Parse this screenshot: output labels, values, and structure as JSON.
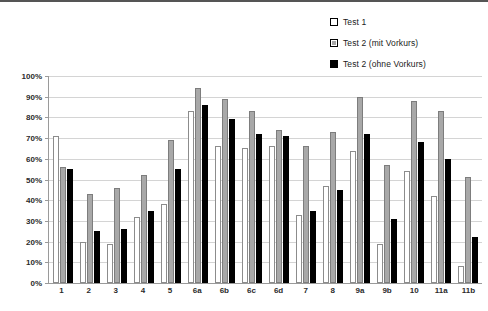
{
  "chart_data": {
    "type": "bar",
    "title": "",
    "subtitle": "",
    "xlabel": "",
    "ylabel": "",
    "ylim": [
      0,
      100
    ],
    "grid": true,
    "legend_position": "top-right",
    "categories": [
      "1",
      "2",
      "3",
      "4",
      "5",
      "6a",
      "6b",
      "6c",
      "6d",
      "7",
      "8",
      "9a",
      "9b",
      "10",
      "11a",
      "11b"
    ],
    "ytick_labels": [
      "100%",
      "90%",
      "80%",
      "70%",
      "60%",
      "50%",
      "40%",
      "30%",
      "20%",
      "10%",
      "0%"
    ],
    "ytick_values": [
      100,
      90,
      80,
      70,
      60,
      50,
      40,
      30,
      20,
      10,
      0
    ],
    "series": [
      {
        "name": "Test 1",
        "style": "white",
        "color": "#ffffff",
        "values": [
          71,
          20,
          19,
          32,
          38,
          83,
          66,
          65,
          66,
          33,
          47,
          64,
          19,
          54,
          42,
          8
        ]
      },
      {
        "name": "Test 2 (mit Vorkurs)",
        "style": "gray",
        "color": "#a8a8a8",
        "values": [
          56,
          43,
          46,
          52,
          69,
          94,
          89,
          83,
          74,
          66,
          73,
          90,
          57,
          88,
          83,
          51
        ]
      },
      {
        "name": "Test 2 (ohne Vorkurs)",
        "style": "black",
        "color": "#000000",
        "values": [
          55,
          25,
          26,
          35,
          55,
          86,
          79,
          72,
          71,
          35,
          45,
          72,
          31,
          68,
          60,
          22
        ]
      }
    ]
  },
  "legend": {
    "items": [
      {
        "label": "Test 1",
        "swatch": "white"
      },
      {
        "label": "Test 2 (mit Vorkurs)",
        "swatch": "gray"
      },
      {
        "label": "Test 2 (ohne Vorkurs)",
        "swatch": "black"
      }
    ]
  }
}
